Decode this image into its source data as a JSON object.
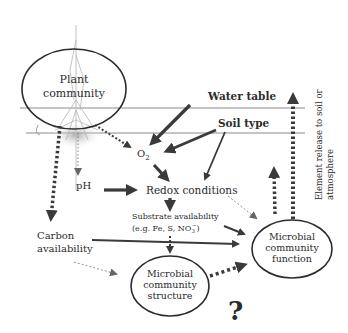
{
  "diagram": {
    "nodes": {
      "plant_community": {
        "line1": "Plant",
        "line2": "community"
      },
      "water_table": "Water table",
      "soil_type": "Soil type",
      "o2": {
        "base": "O",
        "sub": "2"
      },
      "ph": "pH",
      "redox": "Redox conditions",
      "substrate": {
        "line1": "Substrate availability",
        "line2_prefix": "(e.g. Fe, S, NO",
        "line2_sub": "3",
        "line2_sup": "−",
        "line2_suffix": ")"
      },
      "carbon": {
        "line1": "Carbon",
        "line2": "availability"
      },
      "microbial_structure": {
        "line1": "Microbial",
        "line2": "community",
        "line3": "structure"
      },
      "microbial_function": {
        "line1": "Microbial",
        "line2": "community",
        "line3": "function"
      },
      "element_release": {
        "line1": "Element release to soil or",
        "line2": "atmosphere"
      },
      "question": "?"
    },
    "colors": {
      "ink": "#2b2b2b",
      "arrow": "#3a3a3a",
      "layer_line": "#8a8a8a",
      "root_gray": "#b5b5b5"
    }
  }
}
